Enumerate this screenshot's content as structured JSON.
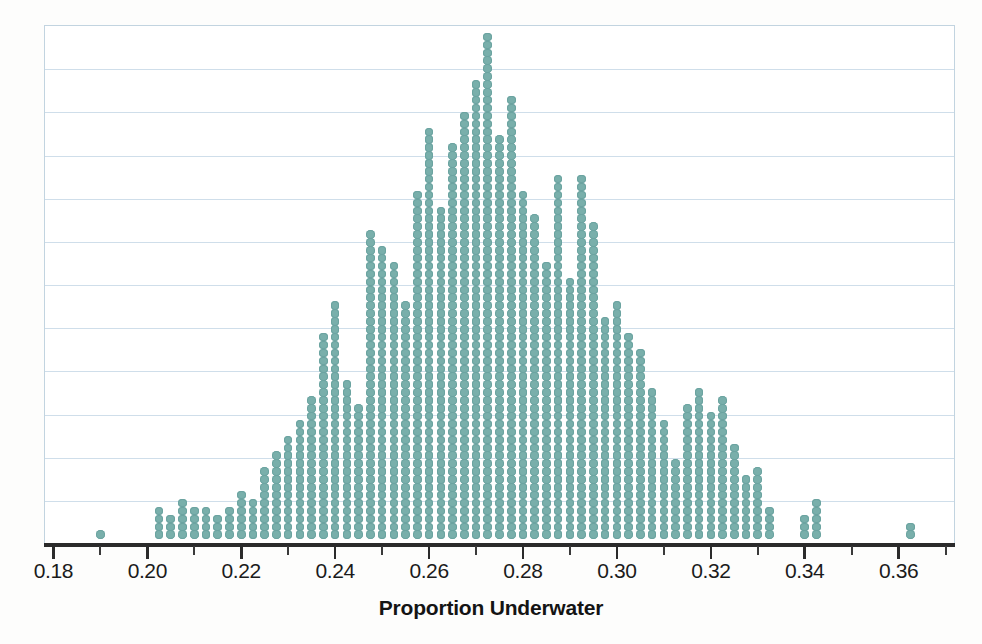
{
  "chart_data": {
    "type": "dot-plot",
    "title": "",
    "xlabel": "Proportion Underwater",
    "ylabel": "",
    "xlim": [
      0.178,
      0.372
    ],
    "grid": true,
    "legend": null,
    "dot_color": "#79afab",
    "gridline_color": "#cfdeea",
    "axis_color": "#2b2b2b",
    "bin_width": 0.0025,
    "dot_unit": 1,
    "gridline_count": 11,
    "tick_labels": [
      "0.18",
      "0.20",
      "0.22",
      "0.24",
      "0.26",
      "0.28",
      "0.30",
      "0.32",
      "0.34",
      "0.36"
    ],
    "tick_values": [
      0.18,
      0.2,
      0.22,
      0.24,
      0.26,
      0.28,
      0.3,
      0.32,
      0.34,
      0.36
    ],
    "minor_tick_values": [
      0.19,
      0.21,
      0.23,
      0.25,
      0.27,
      0.29,
      0.31,
      0.33,
      0.35,
      0.37
    ],
    "total_dots": 1000,
    "max_stack": 64,
    "peak_x": 0.2725,
    "x": [
      0.19,
      0.2025,
      0.205,
      0.2075,
      0.21,
      0.2125,
      0.215,
      0.2175,
      0.22,
      0.2225,
      0.225,
      0.2275,
      0.23,
      0.2325,
      0.235,
      0.2375,
      0.24,
      0.2425,
      0.245,
      0.2475,
      0.25,
      0.2525,
      0.255,
      0.2575,
      0.26,
      0.2625,
      0.265,
      0.2675,
      0.27,
      0.2725,
      0.275,
      0.2775,
      0.28,
      0.2825,
      0.285,
      0.2875,
      0.29,
      0.2925,
      0.295,
      0.2975,
      0.3,
      0.3025,
      0.305,
      0.3075,
      0.31,
      0.3125,
      0.315,
      0.3175,
      0.32,
      0.3225,
      0.325,
      0.3275,
      0.33,
      0.3325,
      0.34,
      0.3425,
      0.3625
    ],
    "counts": [
      1,
      4,
      3,
      5,
      4,
      4,
      3,
      4,
      6,
      5,
      9,
      11,
      13,
      15,
      18,
      26,
      30,
      20,
      17,
      39,
      37,
      35,
      30,
      44,
      52,
      42,
      50,
      54,
      58,
      64,
      51,
      56,
      44,
      41,
      35,
      46,
      33,
      46,
      40,
      28,
      30,
      26,
      24,
      19,
      15,
      10,
      17,
      19,
      16,
      18,
      12,
      8,
      9,
      4,
      3,
      5,
      2
    ]
  },
  "axis": {
    "x_title": "Proportion Underwater"
  }
}
